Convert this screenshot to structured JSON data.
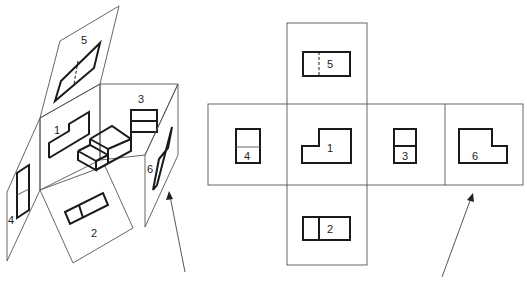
{
  "figure": {
    "left_panel": {
      "labels": [
        "1",
        "2",
        "3",
        "4",
        "5",
        "6"
      ]
    },
    "right_net": {
      "views": [
        {
          "id": "5",
          "position": "top"
        },
        {
          "id": "4",
          "position": "left"
        },
        {
          "id": "1",
          "position": "center"
        },
        {
          "id": "3",
          "position": "right"
        },
        {
          "id": "6",
          "position": "far-right"
        },
        {
          "id": "2",
          "position": "bottom"
        }
      ]
    },
    "colors": {
      "line": "#1a1a1a",
      "thin_line": "#555555",
      "background": "#ffffff"
    }
  }
}
